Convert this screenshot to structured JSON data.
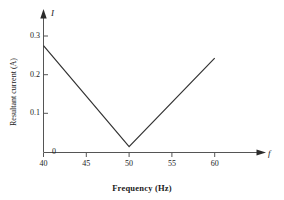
{
  "chart_data": {
    "type": "line",
    "title": "",
    "subtitle": "",
    "xlabel": "Frequency (Hz)",
    "ylabel": "Resultant current (A)",
    "x_variable_symbol": "f",
    "y_variable_symbol": "I",
    "xlim": [
      40,
      60
    ],
    "ylim": [
      0,
      0.32
    ],
    "xticks": [
      40,
      45,
      50,
      55,
      60
    ],
    "xtick_labels": [
      "40",
      "45",
      "50",
      "55",
      "60"
    ],
    "yticks": [
      0,
      0.1,
      0.2,
      0.3
    ],
    "ytick_labels": [
      "0",
      "0.1",
      "0.2",
      "0.3"
    ],
    "grid": false,
    "legend": "none",
    "axis_style": "arrow-terminated-l-axes",
    "series": [
      {
        "name": "Resultant current",
        "color": "#333333",
        "x": [
          40,
          50,
          60
        ],
        "values": [
          0.275,
          0.015,
          0.243
        ]
      }
    ],
    "annotations": [
      {
        "text": "V-shaped minimum at resonance",
        "x": 50,
        "y": 0.015
      }
    ]
  },
  "figure": {
    "background_color": "#ffffff",
    "axis_color": "#555555",
    "curve_color": "#333333"
  }
}
